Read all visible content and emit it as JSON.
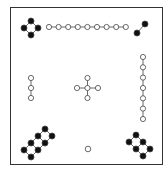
{
  "diagram": {
    "colors": {
      "yin_filled": "#111111",
      "yang_open": "#ffffff",
      "stroke": "#444444",
      "frame": "#333333"
    },
    "groups": [
      {
        "position": "top-left",
        "count": 4,
        "type": "filled",
        "shape": "diamond"
      },
      {
        "position": "top-center",
        "count": 9,
        "type": "open",
        "shape": "horizontal-chain"
      },
      {
        "position": "top-right",
        "count": 2,
        "type": "filled",
        "shape": "diagonal-pair"
      },
      {
        "position": "middle-left",
        "count": 3,
        "type": "open",
        "shape": "vertical-chain"
      },
      {
        "position": "center",
        "count": 5,
        "type": "open",
        "shape": "cross"
      },
      {
        "position": "middle-right",
        "count": 7,
        "type": "open",
        "shape": "vertical-chain"
      },
      {
        "position": "bottom-left",
        "count": 8,
        "type": "filled",
        "shape": "ladder"
      },
      {
        "position": "bottom-center",
        "count": 1,
        "type": "open",
        "shape": "single"
      },
      {
        "position": "bottom-right",
        "count": 6,
        "type": "filled",
        "shape": "ladder"
      }
    ],
    "grid": [
      [
        4,
        9,
        2
      ],
      [
        3,
        5,
        7
      ],
      [
        8,
        1,
        6
      ]
    ]
  }
}
